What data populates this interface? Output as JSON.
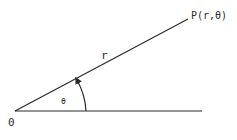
{
  "diagram": {
    "labels": {
      "origin": "0",
      "radius": "r",
      "angle": "θ",
      "point": "P(r,θ)"
    },
    "colors": {
      "stroke": "#2a2a2a",
      "background": "#ffffff"
    }
  }
}
